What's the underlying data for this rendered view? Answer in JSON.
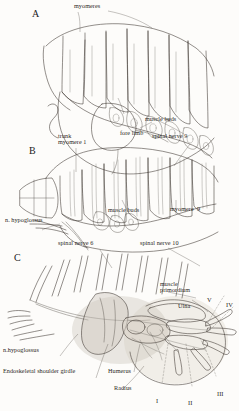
{
  "figure": {
    "type": "anatomical-illustration",
    "panels": [
      {
        "letter": "A",
        "labels": [
          "myomeres",
          "muscle buds",
          "fore limb",
          "trunk",
          "myomere 1"
        ]
      },
      {
        "letter": "B",
        "labels": [
          "trunk",
          "myomere 1",
          "spinal nerve 9",
          "muscle buds",
          "myomere  9",
          "n. hypoglossus"
        ]
      },
      {
        "letter": "C",
        "labels": [
          "spinal nerve 6",
          "spinal nerve 10",
          "muscle",
          "primordium",
          "Ulna",
          "n.hypoglossus",
          "Endoskeletal shoulder girdle",
          "Humerus",
          "Radius"
        ],
        "digits": [
          "I",
          "II",
          "III",
          "IV",
          "V"
        ]
      }
    ],
    "colors": {
      "ink": "#3a342e",
      "paper": "#fdfcfa",
      "shading": "#cfc8bf"
    }
  },
  "panelA": {
    "letter": "A",
    "myomeres": "myomeres",
    "muscle_buds": "muscle buds",
    "fore_limb": "fore limb"
  },
  "panelB": {
    "letter": "B",
    "trunk": "trunk",
    "myomere_1": "myomere 1",
    "spinal_nerve_9": "spinal nerve 9",
    "muscle_buds": "muscle buds",
    "myomere_9": "myomere  9",
    "n_hypoglossus": "n. hypoglossus"
  },
  "panelC": {
    "letter": "C",
    "spinal_nerve_6": "spinal nerve 6",
    "spinal_nerve_10": "spinal nerve 10",
    "muscle": "muscle",
    "primordium": "primordium",
    "ulna": "Ulna",
    "n_hypoglossus": "n.hypoglossus",
    "shoulder_girdle": "Endoskeletal shoulder girdle",
    "humerus": "Humerus",
    "radius": "Radius",
    "digit_1": "I",
    "digit_2": "II",
    "digit_3": "III",
    "digit_4": "IV",
    "digit_5": "V"
  }
}
